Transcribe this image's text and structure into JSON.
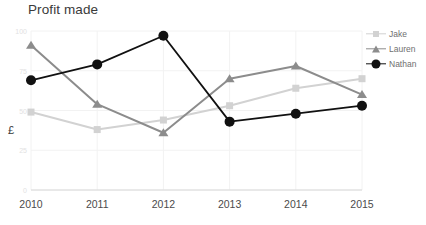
{
  "chart": {
    "title": "Profit made",
    "y_axis_title": "£"
  },
  "legend": {
    "items": [
      {
        "label": "Jake",
        "color": "#d2d2d2",
        "marker": "square"
      },
      {
        "label": "Lauren",
        "color": "#8c8c8c",
        "marker": "triangle"
      },
      {
        "label": "Nathan",
        "color": "#111111",
        "marker": "circle"
      }
    ]
  },
  "chart_data": {
    "type": "line",
    "title": "Profit made",
    "xlabel": "",
    "ylabel": "£",
    "categories": [
      "2010",
      "2011",
      "2012",
      "2013",
      "2014",
      "2015"
    ],
    "x_tick_labels": [
      "2010",
      "2011",
      "2012",
      "2013",
      "2014",
      "2015"
    ],
    "y_tick_labels": [
      "100",
      "75",
      "50",
      "25",
      "0"
    ],
    "y_ticks": [
      100,
      75,
      50,
      25,
      0
    ],
    "ylim": [
      0,
      100
    ],
    "grid": true,
    "legend_position": "right",
    "series": [
      {
        "name": "Jake",
        "color": "#d2d2d2",
        "marker": "square",
        "values": [
          49,
          38,
          44,
          53,
          64,
          70
        ]
      },
      {
        "name": "Lauren",
        "color": "#8c8c8c",
        "marker": "triangle",
        "values": [
          91,
          54,
          36,
          70,
          78,
          60
        ]
      },
      {
        "name": "Nathan",
        "color": "#111111",
        "marker": "circle",
        "values": [
          69,
          79,
          97,
          43,
          48,
          53
        ]
      }
    ]
  }
}
